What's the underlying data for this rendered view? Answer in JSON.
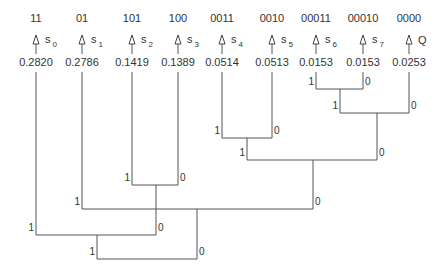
{
  "leaves": [
    {
      "code": "11",
      "symbol": "s",
      "sub": "0",
      "prob": "0.2820",
      "x": 36
    },
    {
      "code": "01",
      "symbol": "s",
      "sub": "1",
      "prob": "0.2786",
      "x": 82
    },
    {
      "code": "101",
      "symbol": "s",
      "sub": "2",
      "prob": "0.1419",
      "x": 132
    },
    {
      "code": "100",
      "symbol": "s",
      "sub": "3",
      "prob": "0.1389",
      "x": 178
    },
    {
      "code": "0011",
      "symbol": "s",
      "sub": "4",
      "prob": "0.0514",
      "x": 222
    },
    {
      "code": "0010",
      "symbol": "s",
      "sub": "5",
      "prob": "0.0513",
      "x": 272
    },
    {
      "code": "00011",
      "symbol": "s",
      "sub": "6",
      "prob": "0.0153",
      "x": 316
    },
    {
      "code": "00010",
      "symbol": "s",
      "sub": "7",
      "prob": "0.0153",
      "x": 363
    },
    {
      "code": "0000",
      "symbol": "Q",
      "sub": "",
      "prob": "0.0253",
      "x": 409
    }
  ],
  "merges": [
    {
      "left_x": 316,
      "right_x": 363,
      "y": 89,
      "left_top": 72,
      "right_top": 72,
      "left_bit": "1",
      "right_bit": "0"
    },
    {
      "left_x": 340,
      "right_x": 409,
      "y": 113,
      "left_top": 89,
      "right_top": 72,
      "left_bit": "1",
      "right_bit": "0"
    },
    {
      "left_x": 222,
      "right_x": 272,
      "y": 138,
      "left_top": 72,
      "right_top": 72,
      "left_bit": "1",
      "right_bit": "0"
    },
    {
      "left_x": 247,
      "right_x": 377,
      "y": 160,
      "left_top": 138,
      "right_top": 113,
      "left_bit": "1",
      "right_bit": "0"
    },
    {
      "left_x": 132,
      "right_x": 178,
      "y": 185,
      "left_top": 72,
      "right_top": 72,
      "left_bit": "1",
      "right_bit": "0"
    },
    {
      "left_x": 82,
      "right_x": 313,
      "y": 209,
      "left_top": 72,
      "right_top": 160,
      "left_bit": "1",
      "right_bit": "0"
    },
    {
      "left_x": 36,
      "right_x": 156,
      "y": 235,
      "left_top": 72,
      "right_top": 185,
      "left_bit": "1",
      "right_bit": "0"
    },
    {
      "left_x": 97,
      "right_x": 197,
      "y": 259,
      "left_top": 235,
      "right_top": 209,
      "left_bit": "1",
      "right_bit": "0"
    }
  ]
}
